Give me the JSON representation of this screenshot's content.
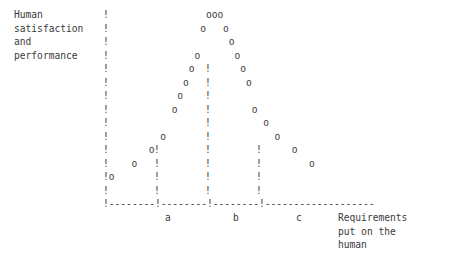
{
  "figure": {
    "kind": "ascii-art-plot",
    "background_color": "#ffffff",
    "ink_color": "#3a3a3a",
    "axis_char": "!",
    "baseline_char": "-",
    "point_char": "o",
    "columns": 78,
    "rows": 19
  },
  "labels": {
    "y_axis_line1": "Human",
    "y_axis_line2": "satisfaction",
    "y_axis_line3": "and",
    "y_axis_line4": "performance",
    "x_axis_line1": "Requirements",
    "x_axis_line2": "put on the",
    "x_axis_line3": "human",
    "tick_a": "a",
    "tick_b": "b",
    "tick_c": "c"
  },
  "chart_data": {
    "type": "scatter",
    "title": "",
    "subtitle": "",
    "xlabel": "Requirements put on the human",
    "ylabel": "Human satisfaction and performance",
    "grid": false,
    "legend": null,
    "axis_style": "ascii",
    "xtick_labels": [
      "a",
      "b",
      "c"
    ],
    "xtick_columns": [
      27,
      36,
      45
    ],
    "ytick_labels": [],
    "xlim": [
      18,
      77
    ],
    "ylim": [
      0,
      14
    ],
    "note": "Inverted-U (bell) curve: satisfaction and performance rise with requirements up to an optimum near b, then fall.",
    "points": [
      {
        "col": 19,
        "row": 1
      },
      {
        "col": 23,
        "row": 2
      },
      {
        "col": 26,
        "row": 3
      },
      {
        "col": 28,
        "row": 4
      },
      {
        "col": 30,
        "row": 6
      },
      {
        "col": 31,
        "row": 7
      },
      {
        "col": 32,
        "row": 8
      },
      {
        "col": 33,
        "row": 9
      },
      {
        "col": 34,
        "row": 10
      },
      {
        "col": 35,
        "row": 12
      },
      {
        "col": 36,
        "row": 13
      },
      {
        "col": 37,
        "row": 13
      },
      {
        "col": 38,
        "row": 13
      },
      {
        "col": 39,
        "row": 12
      },
      {
        "col": 40,
        "row": 11
      },
      {
        "col": 41,
        "row": 10
      },
      {
        "col": 42,
        "row": 9
      },
      {
        "col": 43,
        "row": 8
      },
      {
        "col": 44,
        "row": 6
      },
      {
        "col": 46,
        "row": 5
      },
      {
        "col": 48,
        "row": 4
      },
      {
        "col": 51,
        "row": 3
      },
      {
        "col": 54,
        "row": 2
      }
    ],
    "rows_ascii": [
      "Human        !",
      "satisfaction !",
      "and          !",
      "performance  !",
      "             !                  ooo",
      "             !               o   !   o",
      "             !              o    !    o",
      "             !             o     !     o",
      "             !            o      !      o",
      "             !           o       !       o",
      "             !          o        !        o",
      "             !        o          !         o",
      "             !      o !          !          o",
      "             !    o   !          !          !  o",
      "             !  o     !          !          !     o",
      "             !o       !          !          !        o",
      "             !--------!--------!---------!------------------",
      "                      a        b         c   Requirements",
      "                                             put on the",
      "                                             human"
    ]
  }
}
